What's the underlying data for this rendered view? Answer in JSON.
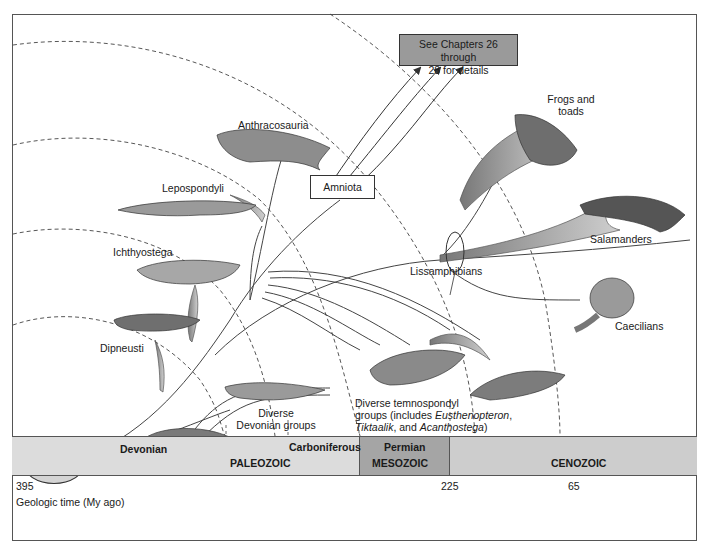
{
  "diagram": {
    "type": "phylogenetic tree",
    "callout_box": "See Chapters 26 through 28 for details",
    "callout_box_lines": [
      "See Chapters 26 through",
      "28 for details"
    ],
    "root": {
      "lines": [
        "Sarcopterygian",
        "ancestor"
      ]
    },
    "taxa": {
      "anthracosauria": "Anthracosauria",
      "amniota": "Amniota",
      "lepospondyli": "Lepospondyli",
      "ichthyostega": "Ichthyostega",
      "dipneusti": "Dipneusti",
      "coelacanth": "Coelacanth",
      "devonian_groups": [
        "Diverse",
        "Devonian groups"
      ],
      "frogs": [
        "Frogs and",
        "toads"
      ],
      "salamanders": "Salamanders",
      "caecilians": "Caecilians",
      "lissamphibians": "Lissamphibians",
      "temnospondyl": {
        "line1": "Diverse temnospondyl",
        "line2_prefix": "groups (includes ",
        "line2_italic": "Eusthenopteron",
        "line2_suffix": ",",
        "line3_italic1": "Tiktaalik",
        "line3_mid": ", and ",
        "line3_italic2": "Acanthostega",
        "line3_suffix": ")"
      }
    }
  },
  "timeline": {
    "periods": {
      "devonian": "Devonian",
      "carboniferous": "Carboniferous",
      "permian": "Permian"
    },
    "eras": {
      "paleozoic": "PALEOZOIC",
      "mesozoic": "MESOZOIC",
      "cenozoic": "CENOZOIC"
    },
    "ticks": {
      "t395": "395",
      "t225": "225",
      "t65": "65"
    },
    "axis_label": "Geologic time (My ago)"
  },
  "colors": {
    "paleozoic_band": "#dcdcdc",
    "mesozoic_band": "#a5a5a5",
    "cenozoic_band": "#cdcdcd",
    "callout_box": "#9a9a9a",
    "root_ellipse": "#d4d4d4"
  }
}
